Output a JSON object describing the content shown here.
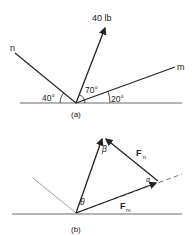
{
  "figure_a": {
    "caption": "(a)",
    "force_label": "40 lb",
    "line_n_label": "n",
    "line_m_label": "m",
    "angle_n": "40°",
    "angle_force": "70°",
    "angle_m": "20°"
  },
  "figure_b": {
    "caption": "(b)",
    "label_fn": "F",
    "label_fn_sub": "n",
    "label_fm": "F",
    "label_fm_sub": "m",
    "angle_beta": "β",
    "angle_theta": "θ",
    "angle_alpha": "α"
  },
  "colors": {
    "line": "#222222",
    "faint": "#888888"
  }
}
